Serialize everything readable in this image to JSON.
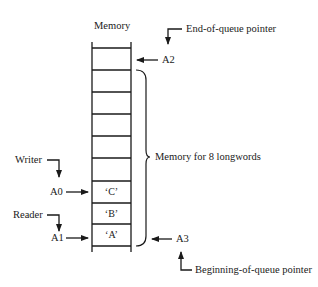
{
  "diagram": {
    "title": "Memory",
    "memory_cells": [
      {
        "index": 0,
        "content": ""
      },
      {
        "index": 1,
        "content": ""
      },
      {
        "index": 2,
        "content": ""
      },
      {
        "index": 3,
        "content": ""
      },
      {
        "index": 4,
        "content": ""
      },
      {
        "index": 5,
        "content": "‘C’"
      },
      {
        "index": 6,
        "content": "‘B’"
      },
      {
        "index": 7,
        "content": "‘A’"
      }
    ],
    "brace_label": "Memory for 8 longwords",
    "pointers": {
      "end_of_queue": {
        "label": "End-of-queue pointer",
        "register": "A2"
      },
      "beginning_of_queue": {
        "label": "Beginning-of-queue pointer",
        "register": "A3"
      },
      "writer": {
        "label": "Writer",
        "register": "A0"
      },
      "reader": {
        "label": "Reader",
        "register": "A1"
      }
    },
    "colors": {
      "ink": "#1a1a1a",
      "background": "#ffffff"
    }
  }
}
